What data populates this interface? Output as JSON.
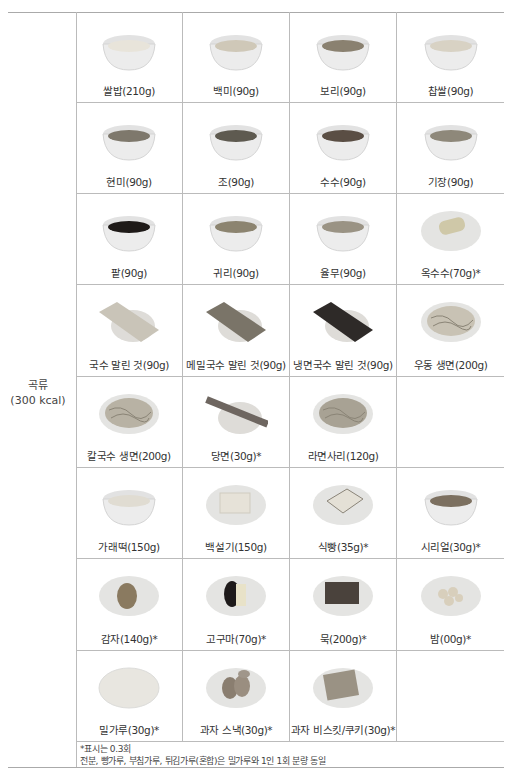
{
  "category": {
    "name": "곡류",
    "kcal": "(300 kcal)"
  },
  "rows": [
    [
      {
        "label": "쌀밥(210g)",
        "icon": "rice-bowl-icon",
        "kind": "bowl",
        "fill": "#e8e4da"
      },
      {
        "label": "백미(90g)",
        "icon": "white-rice-bowl-icon",
        "kind": "bowl",
        "fill": "#cfc8b8"
      },
      {
        "label": "보리(90g)",
        "icon": "barley-bowl-icon",
        "kind": "bowl",
        "fill": "#8a8170"
      },
      {
        "label": "찹쌀(90g)",
        "icon": "glutinous-rice-bowl-icon",
        "kind": "bowl",
        "fill": "#d8d2c4"
      }
    ],
    [
      {
        "label": "현미(90g)",
        "icon": "brown-rice-bowl-icon",
        "kind": "bowl",
        "fill": "#7e786c"
      },
      {
        "label": "조(90g)",
        "icon": "millet-bowl-icon",
        "kind": "bowl",
        "fill": "#5e5a50"
      },
      {
        "label": "수수(90g)",
        "icon": "sorghum-bowl-icon",
        "kind": "bowl",
        "fill": "#5a4e44"
      },
      {
        "label": "기장(90g)",
        "icon": "proso-millet-bowl-icon",
        "kind": "bowl",
        "fill": "#8e887a"
      }
    ],
    [
      {
        "label": "팥(90g)",
        "icon": "red-bean-bowl-icon",
        "kind": "bowl",
        "fill": "#1e1a18"
      },
      {
        "label": "귀리(90g)",
        "icon": "oats-bowl-icon",
        "kind": "bowl",
        "fill": "#8c8470"
      },
      {
        "label": "율무(90g)",
        "icon": "jobs-tears-bowl-icon",
        "kind": "bowl",
        "fill": "#9a9384"
      },
      {
        "label": "옥수수(70g)*",
        "icon": "corn-plate-icon",
        "kind": "corn",
        "fill": "#d8d4c6"
      }
    ],
    [
      {
        "label": "국수 말린 것(90g)",
        "icon": "dried-noodles-plate-icon",
        "kind": "noodle-bundle",
        "fill": "#c9c4b8"
      },
      {
        "label": "메밀국수 말린 것(90g)",
        "icon": "buckwheat-noodles-plate-icon",
        "kind": "noodle-bundle",
        "fill": "#7a7468"
      },
      {
        "label": "냉면국수 말린 것(90g)",
        "icon": "naengmyeon-noodles-plate-icon",
        "kind": "noodle-bundle",
        "fill": "#2e2a28"
      },
      {
        "label": "우동 생면(200g)",
        "icon": "udon-plate-icon",
        "kind": "noodle-pile",
        "fill": "#c8c2b4"
      }
    ],
    [
      {
        "label": "칼국수 생면(200g)",
        "icon": "kalguksu-plate-icon",
        "kind": "noodle-pile",
        "fill": "#b8b2a4"
      },
      {
        "label": "당면(30g)*",
        "icon": "glass-noodles-plate-icon",
        "kind": "stick",
        "fill": "#6e6660"
      },
      {
        "label": "라면사리(120g)",
        "icon": "ramen-plate-icon",
        "kind": "noodle-pile",
        "fill": "#a8a294"
      },
      null
    ],
    [
      {
        "label": "가래떡(150g)",
        "icon": "rice-cake-bowl-icon",
        "kind": "bowl",
        "fill": "#e0dcd2"
      },
      {
        "label": "백설기(150g)",
        "icon": "steamed-rice-cake-plate-icon",
        "kind": "block",
        "fill": "#e6e2d8"
      },
      {
        "label": "식빵(35g)*",
        "icon": "bread-plate-icon",
        "kind": "bread",
        "fill": "#e4e0d6"
      },
      {
        "label": "시리얼(30g)*",
        "icon": "cereal-bowl-icon",
        "kind": "bowl",
        "fill": "#7c7060"
      }
    ],
    [
      {
        "label": "감자(140g)*",
        "icon": "potato-plate-icon",
        "kind": "potato",
        "fill": "#8a7a60"
      },
      {
        "label": "고구마(70g)*",
        "icon": "sweet-potato-plate-icon",
        "kind": "sweet-potato",
        "fill": "#1e1a1a"
      },
      {
        "label": "묵(200g)*",
        "icon": "jelly-plate-icon",
        "kind": "block-dark",
        "fill": "#4a423c"
      },
      {
        "label": "밤(00g)*",
        "icon": "chestnut-plate-icon",
        "kind": "chestnuts",
        "fill": "#d8cfbc"
      }
    ],
    [
      {
        "label": "밀가루(30g)*",
        "icon": "flour-plate-icon",
        "kind": "plate",
        "fill": "#e8e6e0"
      },
      {
        "label": "과자 스낵(30g)*",
        "icon": "snack-plate-icon",
        "kind": "snack",
        "fill": "#8a7e70"
      },
      {
        "label": "과자 비스킷/쿠키(30g)*",
        "icon": "biscuit-plate-icon",
        "kind": "biscuit",
        "fill": "#9a9284"
      },
      null
    ]
  ],
  "notes": [
    "*표시는 0.3회",
    "전분, 빵가루, 부침가루, 튀김가루(혼합)은 밀가루와 1인 1회 분량 동일"
  ]
}
